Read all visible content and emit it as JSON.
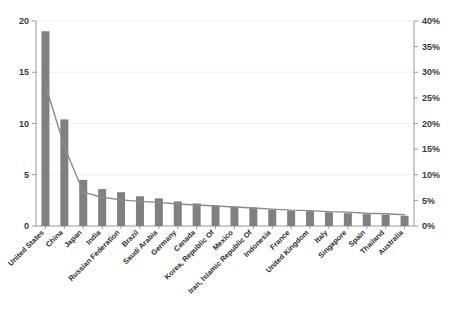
{
  "chart_data": {
    "type": "bar",
    "title": "",
    "subtitle": "",
    "xlabel": "",
    "ylabel": "",
    "y2label": "",
    "ylim": [
      0,
      20
    ],
    "yticks": [
      0,
      5,
      10,
      15,
      20
    ],
    "ytick_labels": [
      "0",
      "5",
      "10",
      "15",
      "20"
    ],
    "y2lim": [
      0,
      40
    ],
    "y2ticks": [
      0,
      5,
      10,
      15,
      20,
      25,
      30,
      35,
      40
    ],
    "y2tick_labels": [
      "0%",
      "5%",
      "10%",
      "15%",
      "20%",
      "25%",
      "30%",
      "35%",
      "40%"
    ],
    "grid": true,
    "legend": "none",
    "categories": [
      "United States",
      "China",
      "Japan",
      "India",
      "Russian Federation",
      "Brazil",
      "Saudi Arabia",
      "Germany",
      "Canada",
      "Korea, Republic Of",
      "Mexico",
      "Iran, Islamic Republic Of",
      "Indonesia",
      "France",
      "United Kingdom",
      "Italy",
      "Singapore",
      "Spain",
      "Thailand",
      "Australia"
    ],
    "series": [
      {
        "name": "Value",
        "type": "bar",
        "axis": "left",
        "color": "#808080",
        "values": [
          19.0,
          10.4,
          4.5,
          3.6,
          3.3,
          2.9,
          2.7,
          2.4,
          2.2,
          2.0,
          1.9,
          1.8,
          1.6,
          1.5,
          1.45,
          1.35,
          1.25,
          1.15,
          1.1,
          1.0
        ]
      },
      {
        "name": "Share",
        "type": "line",
        "axis": "right",
        "color": "#8c8c8c",
        "values": [
          27.5,
          15.5,
          6.6,
          5.6,
          5.1,
          4.8,
          4.6,
          4.3,
          4.1,
          3.9,
          3.7,
          3.5,
          3.3,
          3.1,
          3.0,
          2.8,
          2.7,
          2.5,
          2.4,
          2.2
        ]
      }
    ]
  },
  "style": {
    "bar_color": "#808080",
    "line_color": "#8c8c8c",
    "axis_color": "#9a9a9a",
    "grid_color": "#f0f0f0",
    "text_color": "#2e2e2e",
    "background": "#ffffff"
  }
}
